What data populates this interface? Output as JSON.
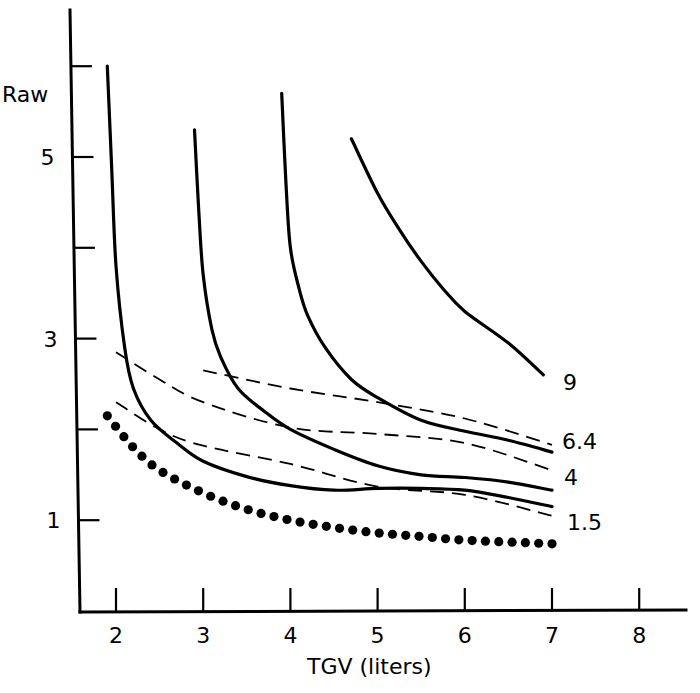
{
  "chart_data": {
    "type": "line",
    "title": "",
    "xlabel": "TGV (liters)",
    "ylabel": "Raw",
    "xlim": [
      1.6,
      8.5
    ],
    "ylim": [
      0,
      6.5
    ],
    "x_ticks": [
      2,
      3,
      4,
      5,
      6,
      7,
      8
    ],
    "x_tick_labels": [
      "2",
      "3",
      "4",
      "5",
      "6",
      "7",
      "8"
    ],
    "y_ticks": [
      1,
      2,
      3,
      4,
      5,
      6
    ],
    "y_tick_labels": [
      "1",
      "",
      "3",
      "",
      "5",
      ""
    ],
    "grid": false,
    "legend": "none (curves labeled directly at right end)",
    "curve_labels": [
      "9",
      "6.4",
      "4",
      "1.5"
    ],
    "series": [
      {
        "name": "solid-curve-1",
        "style": "solid",
        "x": [
          1.9,
          1.95,
          2.0,
          2.1,
          2.2,
          2.4,
          2.7,
          3.0,
          3.5,
          4.0,
          4.5,
          5.0,
          5.5,
          6.0,
          6.5,
          7.0
        ],
        "y": [
          6.0,
          4.9,
          3.8,
          2.9,
          2.45,
          2.1,
          1.85,
          1.65,
          1.48,
          1.38,
          1.33,
          1.35,
          1.35,
          1.33,
          1.25,
          1.15
        ]
      },
      {
        "name": "solid-curve-2",
        "style": "solid",
        "x": [
          2.9,
          2.95,
          3.0,
          3.1,
          3.2,
          3.4,
          3.7,
          4.0,
          4.5,
          5.0,
          5.5,
          6.0,
          6.5,
          7.0
        ],
        "y": [
          5.3,
          4.4,
          3.7,
          3.1,
          2.8,
          2.45,
          2.2,
          2.0,
          1.78,
          1.6,
          1.5,
          1.47,
          1.42,
          1.33
        ]
      },
      {
        "name": "solid-curve-3",
        "style": "solid",
        "x": [
          3.9,
          3.95,
          4.0,
          4.1,
          4.2,
          4.4,
          4.7,
          5.0,
          5.5,
          6.0,
          6.5,
          7.0
        ],
        "y": [
          5.7,
          4.7,
          4.0,
          3.55,
          3.25,
          2.9,
          2.55,
          2.35,
          2.1,
          1.98,
          1.88,
          1.75
        ]
      },
      {
        "name": "solid-curve-4",
        "label": "9",
        "style": "solid",
        "x": [
          4.7,
          5.0,
          5.25,
          5.5,
          5.75,
          6.0,
          6.5,
          6.9
        ],
        "y": [
          5.2,
          4.6,
          4.2,
          3.85,
          3.55,
          3.3,
          2.95,
          2.6
        ]
      },
      {
        "name": "dashed-line-upper",
        "label": "6.4",
        "style": "dashed",
        "x": [
          3.0,
          4.0,
          5.0,
          6.0,
          7.0
        ],
        "y": [
          2.65,
          2.45,
          2.3,
          2.12,
          1.83
        ]
      },
      {
        "name": "dashed-line-middle",
        "label": "4",
        "style": "dashed",
        "x": [
          2.0,
          2.5,
          3.0,
          4.0,
          5.0,
          6.0,
          7.0
        ],
        "y": [
          2.85,
          2.55,
          2.3,
          2.02,
          1.95,
          1.85,
          1.55
        ]
      },
      {
        "name": "dashed-line-lower",
        "label": "1.5",
        "style": "dashed",
        "x": [
          2.0,
          2.5,
          3.0,
          4.0,
          5.0,
          6.0,
          7.0
        ],
        "y": [
          2.3,
          2.0,
          1.82,
          1.62,
          1.37,
          1.28,
          1.05
        ]
      },
      {
        "name": "dotted-curve",
        "style": "dotted",
        "x": [
          1.9,
          2.2,
          2.5,
          3.0,
          3.5,
          4.0,
          4.5,
          5.0,
          5.5,
          6.0,
          6.5,
          7.0
        ],
        "y": [
          2.15,
          1.8,
          1.55,
          1.3,
          1.12,
          1.0,
          0.92,
          0.86,
          0.82,
          0.78,
          0.76,
          0.74
        ]
      }
    ]
  },
  "labels": {
    "y_axis": "Raw",
    "x_axis": "TGV (liters)"
  }
}
